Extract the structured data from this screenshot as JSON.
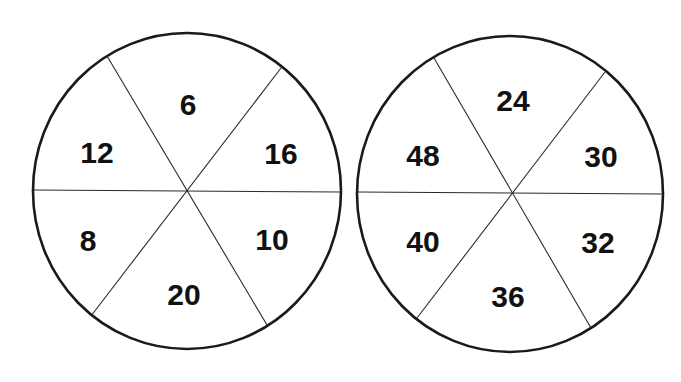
{
  "colors": {
    "background": "#ffffff",
    "outline": "#1a1a1a",
    "text": "#111111"
  },
  "wheels": [
    {
      "id": "left",
      "center": [
        187,
        191
      ],
      "radius": [
        154,
        158
      ],
      "dividers": [
        [
          [
            107,
            56
          ],
          [
            267,
            325
          ]
        ],
        [
          [
            281,
            68
          ],
          [
            91,
            316
          ]
        ],
        [
          [
            33,
            190
          ],
          [
            341,
            192
          ]
        ]
      ],
      "segments": [
        {
          "position": "top",
          "value": "6",
          "x": 188,
          "y": 104
        },
        {
          "position": "upper-right",
          "value": "16",
          "x": 281,
          "y": 153
        },
        {
          "position": "lower-right",
          "value": "10",
          "x": 272,
          "y": 239
        },
        {
          "position": "bottom",
          "value": "20",
          "x": 184,
          "y": 294
        },
        {
          "position": "lower-left",
          "value": "8",
          "x": 88,
          "y": 240
        },
        {
          "position": "upper-left",
          "value": "12",
          "x": 97,
          "y": 152
        }
      ]
    },
    {
      "id": "right",
      "center": [
        510,
        194
      ],
      "radius": [
        153,
        158
      ],
      "dividers": [
        [
          [
            434,
            58
          ],
          [
            591,
            328
          ]
        ],
        [
          [
            605,
            72
          ],
          [
            417,
            318
          ]
        ],
        [
          [
            358,
            192
          ],
          [
            663,
            194
          ]
        ]
      ],
      "segments": [
        {
          "position": "top",
          "value": "24",
          "x": 513,
          "y": 100
        },
        {
          "position": "upper-right",
          "value": "30",
          "x": 601,
          "y": 156
        },
        {
          "position": "lower-right",
          "value": "32",
          "x": 598,
          "y": 242
        },
        {
          "position": "bottom",
          "value": "36",
          "x": 508,
          "y": 296
        },
        {
          "position": "lower-left",
          "value": "40",
          "x": 423,
          "y": 241
        },
        {
          "position": "upper-left",
          "value": "48",
          "x": 423,
          "y": 155
        }
      ]
    }
  ]
}
